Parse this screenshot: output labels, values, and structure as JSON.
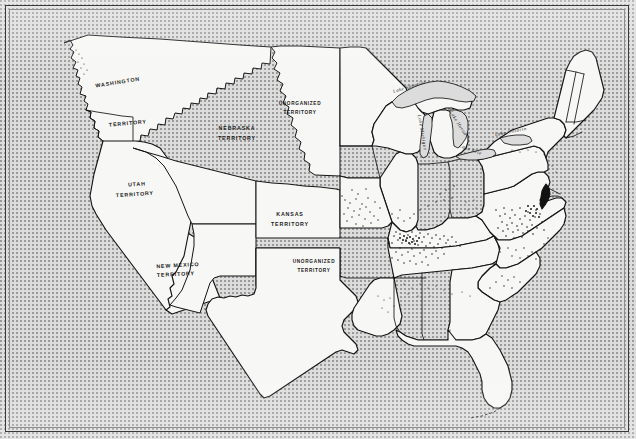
{
  "map": {
    "kind": "historical-map",
    "title": "United States c. 1860 — slave population density map",
    "background_color": "#dcdcdc",
    "land_color": "#f7f7f5",
    "ink_color": "#141414",
    "frame_color": "#3a3a3a"
  },
  "territory_labels": [
    {
      "id": "washington",
      "line1": "WASHINGTON",
      "line2": "TERRITORY",
      "x": 118,
      "y": 84,
      "x2": 128,
      "y2": 125,
      "rot": -9,
      "rot2": -5
    },
    {
      "id": "nebraska",
      "line1": "NEBRASKA",
      "line2": "TERRITORY",
      "x": 237,
      "y": 130,
      "x2": 237,
      "y2": 140,
      "rot": 0,
      "rot2": 0
    },
    {
      "id": "utah",
      "line1": "UTAH",
      "line2": "TERRITORY",
      "x": 137,
      "y": 186,
      "x2": 135,
      "y2": 196,
      "rot": -4,
      "rot2": -4
    },
    {
      "id": "new-mexico",
      "line1": "NEW MEXICO",
      "line2": "TERRITORY",
      "x": 178,
      "y": 267,
      "x2": 176,
      "y2": 276,
      "rot": -3,
      "rot2": -3
    },
    {
      "id": "kansas",
      "line1": "KANSAS",
      "line2": "TERRITORY",
      "x": 290,
      "y": 216,
      "x2": 290,
      "y2": 226,
      "rot": 0,
      "rot2": 0
    },
    {
      "id": "unorg-north",
      "line1": "UNORGANIZED",
      "line2": "TERRITORY",
      "x": 300,
      "y": 105,
      "x2": 300,
      "y2": 114,
      "rot": 0,
      "rot2": 0
    },
    {
      "id": "unorg-south",
      "line1": "UNORGANIZED",
      "line2": "TERRITORY",
      "x": 314,
      "y": 263,
      "x2": 314,
      "y2": 272,
      "rot": 0,
      "rot2": 0
    }
  ],
  "lake_labels": [
    {
      "id": "lake-superior",
      "text": "Lake Superior",
      "x": 410,
      "y": 88,
      "rot": -17
    },
    {
      "id": "lake-michigan",
      "text": "Lake Michigan",
      "x": 421,
      "y": 133,
      "rot": 80
    },
    {
      "id": "lake-huron",
      "text": "Lake Huron",
      "x": 457,
      "y": 124,
      "rot": 58
    },
    {
      "id": "lake-erie",
      "text": "Lake Erie",
      "x": 470,
      "y": 151,
      "rot": 20
    },
    {
      "id": "lake-ontario",
      "text": "Lake Ontario",
      "x": 511,
      "y": 133,
      "rot": -11
    }
  ],
  "legend_note": "",
  "density_regions": [
    {
      "id": "chesapeake-tidewater",
      "intensity": "very-high"
    },
    {
      "id": "kentucky-tennessee-bluegrass",
      "intensity": "high"
    },
    {
      "id": "missouri-river-valley",
      "intensity": "medium"
    },
    {
      "id": "ohio-valley",
      "intensity": "low"
    },
    {
      "id": "south-carolina-low-country",
      "intensity": "low"
    }
  ]
}
